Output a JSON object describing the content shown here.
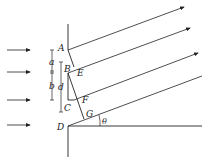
{
  "diagram": {
    "labels": {
      "A": "A",
      "B": "B",
      "C": "C",
      "D": "D",
      "E": "E",
      "F": "F",
      "G": "G",
      "a": "a",
      "b": "b",
      "d": "d",
      "theta": "θ"
    },
    "incident_rays": 4,
    "diffracted_rays": 4,
    "colors": {
      "stroke": "#222222",
      "background": "#ffffff"
    }
  }
}
